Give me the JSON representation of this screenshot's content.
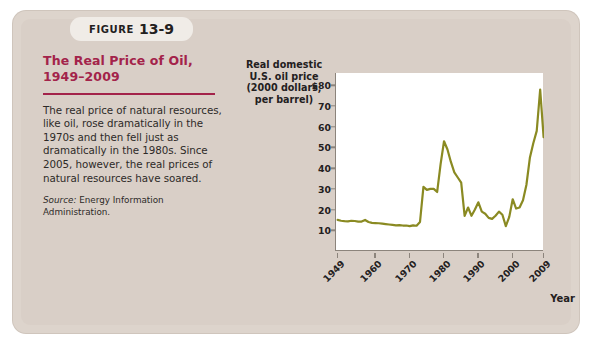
{
  "figure": {
    "tab_word": "FIGURE",
    "tab_number": "13-9",
    "title": "The Real Price of Oil,\n1949–2009",
    "body": "The real price of natural resources, like oil, rose dramatically in the 1970s and then fell just as dramatically in the 1980s. Since 2005, however, the real prices of natural resources have soared.",
    "source_label": "Source:",
    "source_text": "Energy Information Administration.",
    "accent_color": "#a3234a",
    "panel_color": "#d9cfc7"
  },
  "chart_data": {
    "type": "line",
    "title": "",
    "ylabel": "Real domestic\nU.S. oil price\n(2000 dollars,\nper barrel)",
    "xlabel": "Year",
    "line_color": "#8a8a22",
    "grid": false,
    "legend": "none",
    "xlim": [
      1949,
      2009
    ],
    "ylim": [
      0,
      85
    ],
    "ytick_labels": [
      "$80",
      "70",
      "60",
      "50",
      "40",
      "30",
      "20",
      "10"
    ],
    "ytick_values": [
      80,
      70,
      60,
      50,
      40,
      30,
      20,
      10
    ],
    "xtick_labels": [
      "1949",
      "1960",
      "1970",
      "1980",
      "1990",
      "2000",
      "2009"
    ],
    "xtick_values": [
      1949,
      1960,
      1970,
      1980,
      1990,
      2000,
      2009
    ],
    "x": [
      1949,
      1950,
      1951,
      1952,
      1953,
      1954,
      1955,
      1956,
      1957,
      1958,
      1959,
      1960,
      1961,
      1962,
      1963,
      1964,
      1965,
      1966,
      1967,
      1968,
      1969,
      1970,
      1971,
      1972,
      1973,
      1974,
      1975,
      1976,
      1977,
      1978,
      1979,
      1980,
      1981,
      1982,
      1983,
      1984,
      1985,
      1986,
      1987,
      1988,
      1989,
      1990,
      1991,
      1992,
      1993,
      1994,
      1995,
      1996,
      1997,
      1998,
      1999,
      2000,
      2001,
      2002,
      2003,
      2004,
      2005,
      2006,
      2007,
      2008,
      2009
    ],
    "values": [
      15.0,
      14.6,
      14.4,
      14.3,
      14.6,
      14.5,
      14.2,
      14.2,
      15.0,
      14.0,
      13.6,
      13.5,
      13.4,
      13.2,
      13.0,
      12.8,
      12.6,
      12.4,
      12.5,
      12.3,
      12.3,
      12.0,
      12.4,
      12.2,
      14.0,
      31.0,
      29.5,
      30.0,
      30.0,
      28.5,
      42.0,
      53.0,
      49.0,
      43.0,
      38.0,
      35.5,
      33.0,
      17.0,
      21.0,
      17.0,
      20.0,
      23.5,
      19.0,
      18.0,
      16.0,
      15.5,
      17.0,
      19.0,
      17.5,
      12.0,
      16.5,
      25.0,
      20.5,
      21.0,
      24.5,
      32.0,
      45.0,
      52.0,
      58.0,
      78.0,
      55.0
    ],
    "series_name": "Real domestic U.S. oil price"
  }
}
